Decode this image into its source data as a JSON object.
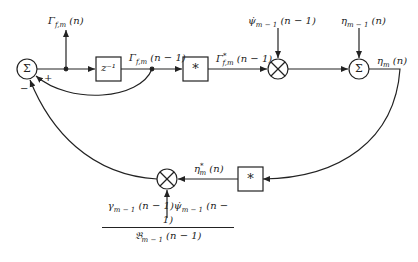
{
  "diagram": {
    "type": "signal-flow block diagram",
    "nodes": {
      "sum_left": {
        "symbol": "Σ",
        "input_signs": {
          "plus": "+",
          "minus": "−"
        }
      },
      "delay": {
        "label": "z⁻¹"
      },
      "conj_upper": {
        "label": "*"
      },
      "mult_upper": {
        "symbol": "⊗"
      },
      "sum_right": {
        "symbol": "Σ"
      },
      "conj_lower": {
        "label": "*"
      },
      "mult_lower": {
        "symbol": "⊗"
      }
    },
    "signals": {
      "gamma_out": "Γf,m (n)",
      "gamma_delayed": "Γf,m (n − 1)",
      "gamma_conj": "Γ*f,m (n − 1)",
      "psi_input": "ψ̇m − 1 (n − 1)",
      "eta_input": "ηm − 1 (n)",
      "eta_out": "ηm (n)",
      "eta_conj": "η*m (n)",
      "gain_numerator": "γm − 1 (n − 1)ψ̇m − 1 (n − 1)",
      "gain_denominator": "𝔅m − 1 (n − 1)"
    }
  }
}
